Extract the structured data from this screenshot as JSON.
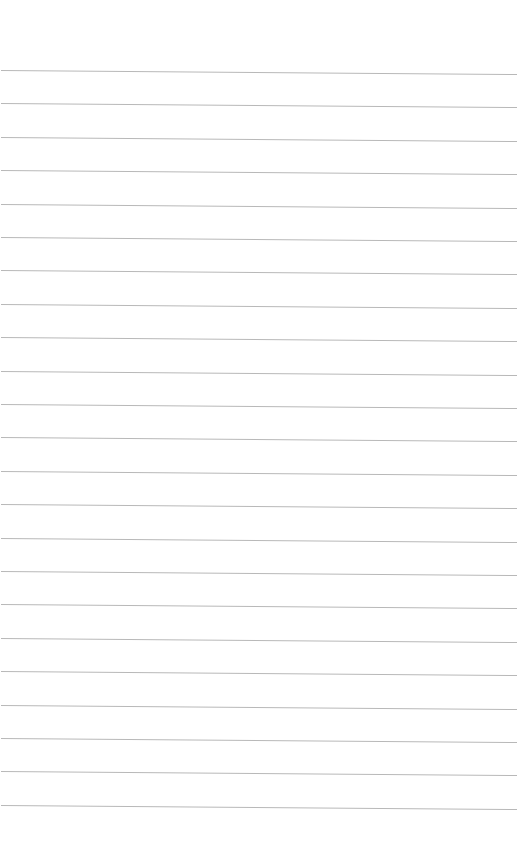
{
  "paper": {
    "background": "#ffffff",
    "line_color": "#b8b8b8",
    "line_count": 23,
    "first_line_y": 70,
    "line_spacing": 33.4
  }
}
